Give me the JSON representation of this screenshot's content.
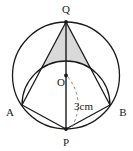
{
  "figure": {
    "type": "geometry-diagram",
    "background_color": "#ffffff",
    "stroke_color": "#1a1a1a",
    "shade_color": "#d9d9d9",
    "dash_color": "#8c8c8c",
    "labels": {
      "q": "Q",
      "o": "O",
      "a": "A",
      "b": "B",
      "p": "P",
      "radius_dimension": "3cm"
    },
    "points": {
      "center_o": {
        "x": 66,
        "y": 75.5
      },
      "top_q": {
        "x": 66,
        "y": 22
      },
      "bottom_p": {
        "x": 66,
        "y": 129
      },
      "left_a": {
        "x": 22,
        "y": 105
      },
      "right_b": {
        "x": 110,
        "y": 105
      }
    },
    "circle": {
      "cx": 66,
      "cy": 75.5,
      "r": 53.5
    },
    "semicircle_on_ab": {
      "cx": 66,
      "cy": 105,
      "r": 44
    },
    "measurements": {
      "radius_value": 3,
      "radius_unit": "cm"
    }
  }
}
